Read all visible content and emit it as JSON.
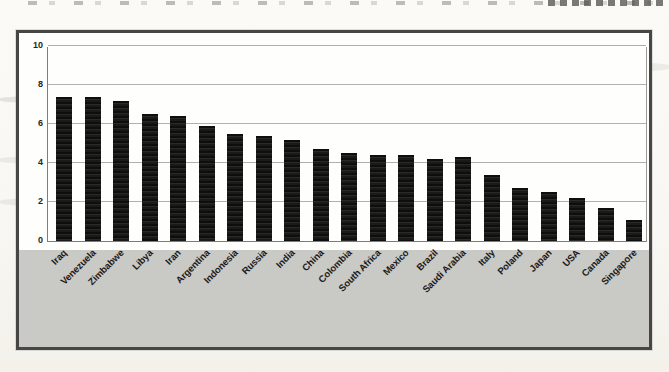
{
  "chart_data": {
    "type": "bar",
    "title": "",
    "xlabel": "",
    "ylabel": "",
    "categories": [
      "Iraq",
      "Venezuela",
      "Zimbabwe",
      "Libya",
      "Iran",
      "Argentina",
      "Indonesia",
      "Russia",
      "India",
      "China",
      "Colombia",
      "South Africa",
      "Mexico",
      "Brazil",
      "Saudi Arabia",
      "Italy",
      "Poland",
      "Japan",
      "USA",
      "Canada",
      "Singapore"
    ],
    "values": [
      7.4,
      7.4,
      7.2,
      6.5,
      6.4,
      5.9,
      5.5,
      5.4,
      5.2,
      4.7,
      4.5,
      4.4,
      4.4,
      4.2,
      4.3,
      3.4,
      2.7,
      2.5,
      2.2,
      1.7,
      1.1
    ],
    "ylim": [
      0,
      10
    ],
    "yticks": [
      0,
      2,
      4,
      6,
      8,
      10
    ],
    "ytick_labels": [
      "0",
      "2",
      "4",
      "6",
      "8",
      "10"
    ],
    "grid": true,
    "legend": false,
    "xtick_rotation_deg": 45,
    "colors": {
      "bar": "#161616",
      "gridline": "#b1b0ad",
      "axis": "#7d7c7a",
      "plot_background": "#fefefd",
      "label_area_background": "#c9c9c6",
      "frame_border": "#474645",
      "text": "#1c1b1a"
    }
  }
}
